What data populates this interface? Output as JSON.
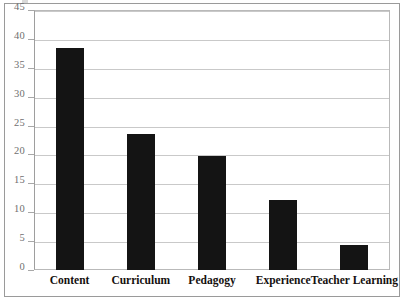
{
  "chart_data": {
    "type": "bar",
    "title": "",
    "subtitle": "",
    "xlabel": "",
    "ylabel": "",
    "categories": [
      "Content",
      "Curriculum",
      "Pedagogy",
      "Experience",
      "Teacher Learning"
    ],
    "values": [
      38.4,
      23.5,
      19.7,
      12.1,
      4.3
    ],
    "ylim": [
      0,
      45
    ],
    "yticks": [
      0,
      5,
      10,
      15,
      20,
      25,
      30,
      35,
      40,
      45
    ],
    "ytick_labels": [
      "0",
      "5",
      "10",
      "15",
      "20",
      "25",
      "30",
      "35",
      "40",
      "45"
    ],
    "grid": true,
    "grid_axis": "y",
    "legend": false,
    "legend_position": "none",
    "bar_color": "#141414",
    "annotations": []
  },
  "style": {
    "background": "#ffffff",
    "grid_color": "#c9c9c9",
    "frame_color": "#9a9a9a",
    "axis_label_color": "#6f6f6f",
    "category_label_color": "#14100e"
  }
}
